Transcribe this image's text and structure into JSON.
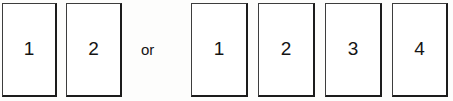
{
  "figure": {
    "background_color": "#fdfdfc",
    "box_fill_color": "#ffffff",
    "box_border_color": "#1c1c1c",
    "text_color": "#141414"
  },
  "conjunction": {
    "label": "or",
    "x": 141,
    "y": 42
  },
  "groups": [
    {
      "name": "left-group",
      "boxes": [
        {
          "label": "1",
          "x": 2,
          "y": 3,
          "width": 55,
          "height": 94
        },
        {
          "label": "2",
          "x": 66,
          "y": 3,
          "width": 56,
          "height": 94
        }
      ]
    },
    {
      "name": "right-group",
      "boxes": [
        {
          "label": "1",
          "x": 191,
          "y": 3,
          "width": 57,
          "height": 94
        },
        {
          "label": "2",
          "x": 258,
          "y": 3,
          "width": 57,
          "height": 94
        },
        {
          "label": "3",
          "x": 325,
          "y": 3,
          "width": 57,
          "height": 94
        },
        {
          "label": "4",
          "x": 392,
          "y": 3,
          "width": 56,
          "height": 94
        }
      ]
    }
  ]
}
